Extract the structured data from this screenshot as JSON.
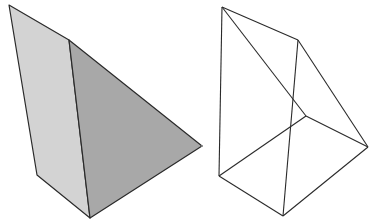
{
  "figures": [
    {
      "name": "shaded-solid",
      "faces": [
        {
          "name": "left-face",
          "points": "9,5 69,40 90,218 37,175",
          "fill": "#d3d3d3"
        },
        {
          "name": "right-face",
          "points": "69,40 202,146 90,218",
          "fill": "#a8a8a8"
        }
      ],
      "stroke": "#2a2a2a"
    },
    {
      "name": "wireframe-solid",
      "edges": [
        [
          222,
          7,
          298,
          40
        ],
        [
          222,
          7,
          219,
          176
        ],
        [
          222,
          7,
          306,
          116
        ],
        [
          298,
          40,
          368,
          147
        ],
        [
          298,
          40,
          283,
          216
        ],
        [
          219,
          176,
          283,
          216
        ],
        [
          283,
          216,
          368,
          147
        ],
        [
          219,
          176,
          306,
          116
        ],
        [
          306,
          116,
          368,
          147
        ]
      ],
      "stroke": "#2a2a2a"
    }
  ],
  "colors": {
    "background": "#ffffff",
    "light_face": "#d3d3d3",
    "dark_face": "#a8a8a8",
    "line": "#2a2a2a"
  }
}
